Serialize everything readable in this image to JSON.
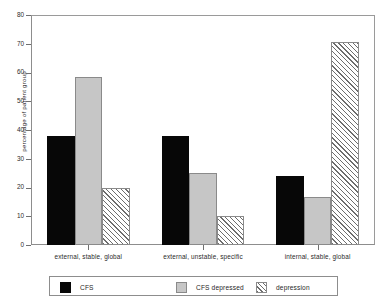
{
  "chart_data": {
    "type": "bar",
    "title": "",
    "xlabel": "",
    "ylabel": "percentage of patient group",
    "ylim": [
      0,
      80
    ],
    "yticks": [
      0,
      10,
      20,
      30,
      40,
      50,
      60,
      70,
      80
    ],
    "grid": false,
    "legend_position": "bottom",
    "categories": [
      "external, stable, global",
      "external, unstable, specific",
      "internal, stable, global"
    ],
    "series": [
      {
        "name": "CFS",
        "color": "#070707",
        "fill": "solid-black",
        "values": [
          38,
          38,
          24
        ]
      },
      {
        "name": "CFS depressed",
        "color": "#c6c6c6",
        "fill": "solid-gray",
        "values": [
          58.5,
          25,
          16.7
        ]
      },
      {
        "name": "depression",
        "color": "#ffffff",
        "fill": "hatched",
        "values": [
          20,
          10,
          70.5
        ]
      }
    ]
  },
  "axis": {
    "y_title": "percentage of patient group",
    "tick_labels": [
      "0",
      "10",
      "20",
      "30",
      "40",
      "50",
      "60",
      "70",
      "80"
    ]
  },
  "legend": {
    "entries": [
      {
        "label": "CFS"
      },
      {
        "label": "CFS depressed"
      },
      {
        "label": "depression"
      }
    ]
  }
}
